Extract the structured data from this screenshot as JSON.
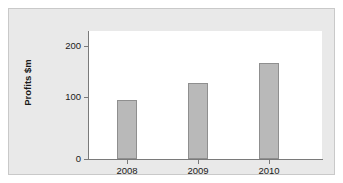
{
  "chart_data": {
    "type": "bar",
    "title": "",
    "subtitle": "",
    "xlabel": "",
    "ylabel": "Profits $m",
    "categories": [
      "2008",
      "2009",
      "2010"
    ],
    "values": [
      105,
      135,
      170
    ],
    "series": [
      {
        "name": "Profits",
        "values": [
          105,
          135,
          170
        ]
      }
    ],
    "ylim": [
      0,
      225
    ],
    "yticks": [
      0,
      100,
      200
    ],
    "ytick_labels": [
      "0",
      "100",
      "200"
    ],
    "grid": false,
    "legend": false,
    "legend_position": "none",
    "bar_color": "#b9b9b9",
    "bar_edge_color": "#8f8f8f",
    "plot_background": "#ffffff",
    "figure_background": "#e9e9e9",
    "axis_color": "#7a7a7a",
    "text_color": "#1a1a1a"
  }
}
